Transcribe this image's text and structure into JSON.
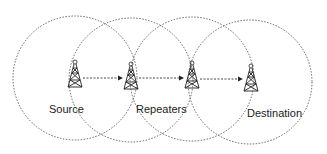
{
  "diagram": {
    "labels": {
      "source": "Source",
      "repeaters": "Repeaters",
      "destination": "Destination"
    },
    "nodes": [
      {
        "id": "source",
        "type": "tower-icon",
        "x": 75,
        "y": 77
      },
      {
        "id": "repeater-1",
        "type": "tower-icon",
        "x": 131,
        "y": 79
      },
      {
        "id": "repeater-2",
        "type": "tower-icon",
        "x": 192,
        "y": 78
      },
      {
        "id": "destination",
        "type": "tower-icon",
        "x": 251,
        "y": 81
      }
    ],
    "coverage_circles": [
      {
        "cx": 75,
        "cy": 78,
        "r": 62
      },
      {
        "cx": 131,
        "cy": 80,
        "r": 62
      },
      {
        "cx": 192,
        "cy": 79,
        "r": 62
      },
      {
        "cx": 250,
        "cy": 82,
        "r": 62
      }
    ],
    "links": [
      {
        "from": "source",
        "to": "repeater-1"
      },
      {
        "from": "repeater-1",
        "to": "repeater-2"
      },
      {
        "from": "repeater-2",
        "to": "destination"
      }
    ],
    "colors": {
      "stroke": "#333333",
      "background": "#ffffff"
    }
  }
}
